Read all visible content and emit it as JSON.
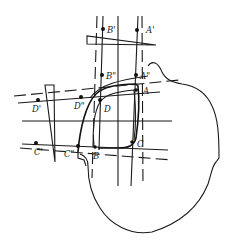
{
  "diagram": {
    "type": "technical projection drawing",
    "colors": {
      "ink": "#1a1a1a",
      "background": "#ffffff"
    },
    "points": [
      {
        "id": "B_prime",
        "label": "B'",
        "x": 103,
        "y": 29
      },
      {
        "id": "A_prime",
        "label": "A'",
        "x": 137,
        "y": 30
      },
      {
        "id": "B_dprime",
        "label": "B\"",
        "x": 102,
        "y": 75
      },
      {
        "id": "A_dprime",
        "label": "A\"",
        "x": 136,
        "y": 75
      },
      {
        "id": "A",
        "label": "A",
        "x": 136,
        "y": 90
      },
      {
        "id": "D_prime",
        "label": "D'",
        "x": 38,
        "y": 100
      },
      {
        "id": "D_dprime",
        "label": "D\"",
        "x": 81,
        "y": 97
      },
      {
        "id": "D",
        "label": "D",
        "x": 100,
        "y": 100
      },
      {
        "id": "C_prime",
        "label": "C'",
        "x": 36,
        "y": 143
      },
      {
        "id": "C_dprime",
        "label": "C\"",
        "x": 78,
        "y": 146
      },
      {
        "id": "B",
        "label": "B",
        "x": 95,
        "y": 147
      },
      {
        "id": "C",
        "label": "C",
        "x": 132,
        "y": 142
      }
    ],
    "labels": {
      "B_prime": "B'",
      "A_prime": "A'",
      "B_dprime": "B\"",
      "A_dprime": "A\"",
      "A": "A",
      "D_prime": "D'",
      "D_dprime": "D\"",
      "D": "D",
      "C_prime": "C'",
      "C_dprime": "C\"",
      "B": "B",
      "C": "C"
    },
    "elements": [
      "head-outline",
      "lens-frame",
      "top-wedge",
      "side-wedge",
      "vertical-projection-lines",
      "horizontal-projection-lines"
    ]
  }
}
